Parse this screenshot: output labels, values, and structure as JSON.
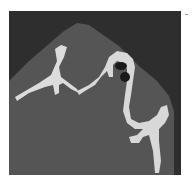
{
  "image": {
    "type": "ct-scan",
    "description": "Grayscale axial CT slice showing bright bone structures on a dark background",
    "colors": {
      "background": "#ffffff",
      "frame": "#2e2e2e",
      "soft_tissue": "#545454",
      "bone": "#e6e6e6"
    }
  }
}
